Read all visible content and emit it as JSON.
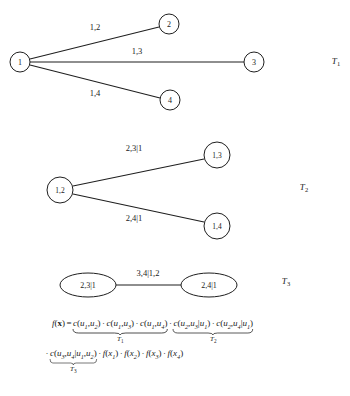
{
  "figure": {
    "caption_tags": [
      "T1",
      "T2",
      "T3"
    ],
    "trees": [
      {
        "id": "tree-1",
        "tag": "T",
        "tag_sub": "1",
        "nodes": [
          {
            "name": "node-1",
            "label": "1",
            "cx": 20,
            "cy": 62,
            "r": 10
          },
          {
            "name": "node-2",
            "label": "2",
            "cx": 169,
            "cy": 24,
            "r": 10
          },
          {
            "name": "node-3",
            "label": "3",
            "cx": 254,
            "cy": 62,
            "r": 10
          },
          {
            "name": "node-4",
            "label": "4",
            "cx": 170,
            "cy": 100,
            "r": 10
          }
        ],
        "edges": [
          {
            "name": "edge-1-2",
            "label": "1,2",
            "x1": 30,
            "y1": 59,
            "x2": 159,
            "y2": 27,
            "lx": 95,
            "ly": 30
          },
          {
            "name": "edge-1-3",
            "label": "1,3",
            "x1": 30,
            "y1": 62,
            "x2": 244,
            "y2": 62,
            "lx": 137,
            "ly": 54
          },
          {
            "name": "edge-1-4",
            "label": "1,4",
            "x1": 30,
            "y1": 65,
            "x2": 160,
            "y2": 98,
            "lx": 95,
            "ly": 96
          }
        ]
      },
      {
        "id": "tree-2",
        "tag": "T",
        "tag_sub": "2",
        "nodes": [
          {
            "name": "node-12",
            "label": "1,2",
            "cx": 60,
            "cy": 190,
            "r": 13
          },
          {
            "name": "node-13",
            "label": "1,3",
            "cx": 217,
            "cy": 155,
            "r": 13
          },
          {
            "name": "node-14",
            "label": "1,4",
            "cx": 217,
            "cy": 226,
            "r": 13
          }
        ],
        "edges": [
          {
            "name": "edge-12-13",
            "label": "2,3|1",
            "x1": 73,
            "y1": 186,
            "x2": 204,
            "y2": 159,
            "lx": 134,
            "ly": 151
          },
          {
            "name": "edge-12-14",
            "label": "2,4|1",
            "x1": 73,
            "y1": 194,
            "x2": 204,
            "y2": 222,
            "lx": 134,
            "ly": 221
          }
        ]
      },
      {
        "id": "tree-3",
        "tag": "T",
        "tag_sub": "3",
        "nodes": [
          {
            "name": "node-231",
            "label": "2,3|1",
            "cx": 88,
            "cy": 285,
            "rx": 28,
            "ry": 12
          },
          {
            "name": "node-241",
            "label": "2,4|1",
            "cx": 209,
            "cy": 285,
            "rx": 28,
            "ry": 12
          }
        ],
        "edges": [
          {
            "name": "edge-231-241",
            "label": "3,4|1,2",
            "x1": 116,
            "y1": 285,
            "x2": 181,
            "y2": 285,
            "lx": 148,
            "ly": 276
          }
        ]
      }
    ],
    "tree_tag_positions": [
      {
        "x": 336,
        "y": 64
      },
      {
        "x": 304,
        "y": 190
      },
      {
        "x": 286,
        "y": 284
      }
    ]
  },
  "formula": {
    "lhs": "f(x)",
    "lhs_fn": "f",
    "lhs_arg": "x",
    "equals": "=",
    "line1": {
      "group_t1": {
        "tag": "T",
        "tag_sub": "1",
        "terms": [
          {
            "fn": "c",
            "args": [
              {
                "base": "u",
                "sub": "1"
              },
              {
                "base": "u",
                "sub": "2"
              }
            ]
          },
          {
            "fn": "c",
            "args": [
              {
                "base": "u",
                "sub": "1"
              },
              {
                "base": "u",
                "sub": "3"
              }
            ]
          },
          {
            "fn": "c",
            "args": [
              {
                "base": "u",
                "sub": "1"
              },
              {
                "base": "u",
                "sub": "4"
              }
            ]
          }
        ],
        "text": "c(u1,u2) · c(u1,u3) · c(u1,u4)"
      },
      "group_t2": {
        "tag": "T",
        "tag_sub": "2",
        "terms": [
          {
            "fn": "c",
            "args": [
              {
                "base": "u",
                "sub": "2"
              },
              {
                "base": "u",
                "sub": "3"
              }
            ],
            "cond": [
              {
                "base": "u",
                "sub": "1"
              }
            ]
          },
          {
            "fn": "c",
            "args": [
              {
                "base": "u",
                "sub": "2"
              },
              {
                "base": "u",
                "sub": "4"
              }
            ],
            "cond": [
              {
                "base": "u",
                "sub": "1"
              }
            ]
          }
        ],
        "text": "c(u2,u3|u1) · c(u2,u4|u1)"
      }
    },
    "line2": {
      "group_t3": {
        "tag": "T",
        "tag_sub": "3",
        "terms": [
          {
            "fn": "c",
            "args": [
              {
                "base": "u",
                "sub": "3"
              },
              {
                "base": "u",
                "sub": "4"
              }
            ],
            "cond": [
              {
                "base": "u",
                "sub": "1"
              },
              {
                "base": "u",
                "sub": "2"
              }
            ]
          }
        ],
        "text": "c(u3,u4|u1,u2)"
      },
      "margins": [
        {
          "fn": "f",
          "arg": {
            "base": "x",
            "sub": "1"
          }
        },
        {
          "fn": "f",
          "arg": {
            "base": "x",
            "sub": "2"
          }
        },
        {
          "fn": "f",
          "arg": {
            "base": "x",
            "sub": "3"
          }
        },
        {
          "fn": "f",
          "arg": {
            "base": "x",
            "sub": "4"
          }
        }
      ],
      "text": "c(u3,u4|u1,u2) · f(x1) · f(x2) · f(x3) · f(x4)"
    },
    "symbols": {
      "dot": "·",
      "bar": "|",
      "comma": ",",
      "lparen": "(",
      "rparen": ")"
    }
  }
}
